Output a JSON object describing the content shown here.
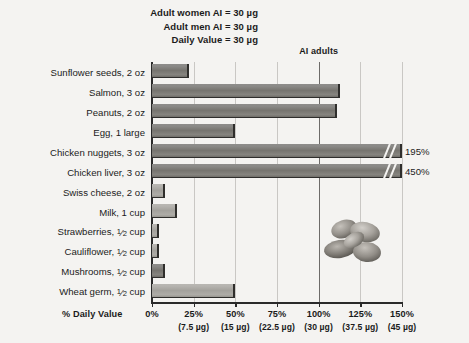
{
  "header": {
    "notes": [
      "Adult women AI = 30 µg",
      "Adult men AI = 30 µg",
      "Daily Value = 30 µg"
    ]
  },
  "reference_line": {
    "label": "AI adults",
    "at_percent": 100
  },
  "axis": {
    "title": "% Daily Value",
    "ticks": [
      {
        "pct": "0%",
        "ug": ""
      },
      {
        "pct": "25%",
        "ug": "(7.5 µg)"
      },
      {
        "pct": "50%",
        "ug": "(15 µg)"
      },
      {
        "pct": "75%",
        "ug": "(22.5 µg)"
      },
      {
        "pct": "100%",
        "ug": "(30 µg)"
      },
      {
        "pct": "125%",
        "ug": "(37.5 µg)"
      },
      {
        "pct": "150%",
        "ug": "(45 µg)"
      }
    ]
  },
  "decoration": {
    "image_name": "peanuts-photo"
  },
  "chart_data": {
    "type": "bar",
    "orientation": "horizontal",
    "title": "",
    "xlabel": "% Daily Value",
    "ylabel": "",
    "xlim": [
      0,
      150
    ],
    "grid": true,
    "legend": false,
    "nutrient_unit": "µg",
    "daily_value_ug": 30,
    "categories": [
      "Sunflower seeds, 2 oz",
      "Salmon, 3 oz",
      "Peanuts, 2 oz",
      "Egg, 1 large",
      "Chicken nuggets, 3 oz",
      "Chicken liver, 3 oz",
      "Swiss cheese, 2 oz",
      "Milk, 1 cup",
      "Strawberries, ½ cup",
      "Cauliflower, ½ cup",
      "Mushrooms, ½ cup",
      "Wheat germ, ½ cup"
    ],
    "values": [
      22,
      113,
      111,
      50,
      195,
      450,
      8,
      15,
      4,
      4,
      8,
      50
    ],
    "bars": [
      {
        "label_main": "Sunflower seeds,",
        "amount": "2 oz",
        "frac": null,
        "value": 22,
        "display_value": "",
        "truncated": false,
        "shade": "dark"
      },
      {
        "label_main": "Salmon,",
        "amount": "3 oz",
        "frac": null,
        "value": 113,
        "display_value": "",
        "truncated": false,
        "shade": "dark"
      },
      {
        "label_main": "Peanuts,",
        "amount": "2 oz",
        "frac": null,
        "value": 111,
        "display_value": "",
        "truncated": false,
        "shade": "dark"
      },
      {
        "label_main": "Egg,",
        "amount": "1 large",
        "frac": null,
        "value": 50,
        "display_value": "",
        "truncated": false,
        "shade": "dark"
      },
      {
        "label_main": "Chicken nuggets,",
        "amount": "3 oz",
        "frac": null,
        "value": 195,
        "display_value": "195%",
        "truncated": true,
        "shade": "dark"
      },
      {
        "label_main": "Chicken liver,",
        "amount": "3 oz",
        "frac": null,
        "value": 450,
        "display_value": "450%",
        "truncated": true,
        "shade": "dark"
      },
      {
        "label_main": "Swiss cheese,",
        "amount": "2 oz",
        "frac": null,
        "value": 8,
        "display_value": "",
        "truncated": false,
        "shade": "light"
      },
      {
        "label_main": "Milk,",
        "amount": "1 cup",
        "frac": null,
        "value": 15,
        "display_value": "",
        "truncated": false,
        "shade": "light"
      },
      {
        "label_main": "Strawberries,",
        "amount": "cup",
        "frac": "1/2",
        "value": 4,
        "display_value": "",
        "truncated": false,
        "shade": "light"
      },
      {
        "label_main": "Cauliflower,",
        "amount": "cup",
        "frac": "1/2",
        "value": 4,
        "display_value": "",
        "truncated": false,
        "shade": "light"
      },
      {
        "label_main": "Mushrooms,",
        "amount": "cup",
        "frac": "1/2",
        "value": 8,
        "display_value": "",
        "truncated": false,
        "shade": "dark"
      },
      {
        "label_main": "Wheat germ,",
        "amount": "cup",
        "frac": "1/2",
        "value": 50,
        "display_value": "",
        "truncated": false,
        "shade": "light"
      }
    ],
    "annotations": [
      {
        "text": "AI adults",
        "at_percent": 100
      },
      {
        "text": "Adult women AI = 30 µg"
      },
      {
        "text": "Adult men AI = 30 µg"
      },
      {
        "text": "Daily Value = 30 µg"
      }
    ]
  }
}
